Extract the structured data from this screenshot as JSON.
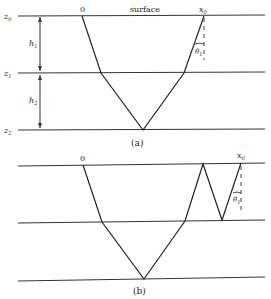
{
  "figure": {
    "panel_a": {
      "caption": "(a)",
      "surface_label": "surface",
      "origin_label": "0",
      "receiver_label": "x",
      "receiver_sub": "0",
      "angle_label": "θ",
      "angle_sub": "1",
      "layers": [
        {
          "label": "z",
          "sub": "0"
        },
        {
          "label": "z",
          "sub": "1"
        },
        {
          "label": "z",
          "sub": "2"
        }
      ],
      "thicknesses": [
        {
          "label": "h",
          "sub": "1"
        },
        {
          "label": "h",
          "sub": "2"
        }
      ]
    },
    "panel_b": {
      "caption": "(b)",
      "origin_label": "0",
      "receiver_label": "x",
      "receiver_sub": "0",
      "angle_label": "θ",
      "angle_sub": "1"
    }
  }
}
